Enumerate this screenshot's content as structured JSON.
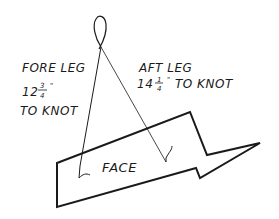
{
  "diagram": {
    "fore_leg": {
      "label": "FORE LEG",
      "whole": "12",
      "num": "3",
      "den": "4",
      "unit": "\"",
      "suffix": "TO KNOT"
    },
    "aft_leg": {
      "label": "AFT LEG",
      "whole": "14",
      "num": "1",
      "den": "4",
      "unit": "\"",
      "suffix": "TO KNOT"
    },
    "face_label": "FACE",
    "colors": {
      "ink": "#1a1a1a",
      "background": "#ffffff"
    }
  }
}
